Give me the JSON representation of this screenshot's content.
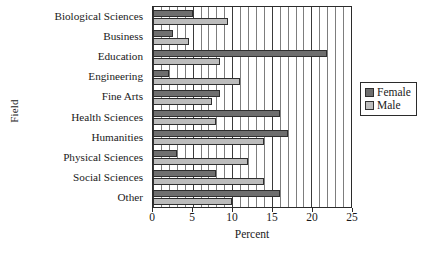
{
  "chart_data": {
    "type": "bar",
    "orientation": "horizontal",
    "title": "",
    "xlabel": "Percent",
    "ylabel": "Field",
    "xlim": [
      0,
      25
    ],
    "xticks": [
      0,
      5,
      10,
      15,
      20,
      25
    ],
    "xtick_labels": [
      "0",
      "5",
      "10",
      "15",
      "20",
      "25"
    ],
    "grid": true,
    "grid_minor_step": 1,
    "grid_major_step": 5,
    "legend_position": "right",
    "categories": [
      "Biological Sciences",
      "Business",
      "Education",
      "Engineering",
      "Fine Arts",
      "Health Sciences",
      "Humanities",
      "Physical Sciences",
      "Social Sciences",
      "Other"
    ],
    "series": [
      {
        "name": "Female",
        "color": "#6e6e6e",
        "values": [
          5.0,
          2.5,
          22.0,
          2.0,
          8.5,
          16.0,
          17.0,
          3.0,
          8.0,
          16.0
        ]
      },
      {
        "name": "Male",
        "color": "#bcbcbc",
        "values": [
          9.5,
          4.5,
          8.5,
          11.0,
          7.5,
          8.0,
          14.0,
          12.0,
          14.0,
          10.0
        ]
      }
    ]
  },
  "legend": {
    "entries": [
      {
        "label": "Female",
        "swatch": "female"
      },
      {
        "label": "Male",
        "swatch": "male"
      }
    ]
  }
}
